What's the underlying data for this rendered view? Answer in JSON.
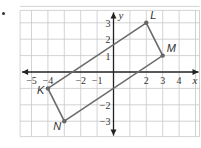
{
  "figure": {
    "problem_marker": ".",
    "axes": {
      "x_label": "x",
      "y_label": "y",
      "x_range": [
        -6,
        5
      ],
      "y_range": [
        -4,
        4
      ],
      "x_ticks": [
        {
          "value": -5,
          "label": "−5"
        },
        {
          "value": -4,
          "label": "−4"
        },
        {
          "value": -2,
          "label": "−2"
        },
        {
          "value": -1,
          "label": "−1"
        },
        {
          "value": 2,
          "label": "2"
        },
        {
          "value": 3,
          "label": "3"
        },
        {
          "value": 4,
          "label": "4"
        }
      ],
      "y_ticks": [
        {
          "value": 3,
          "label": "3"
        },
        {
          "value": 2,
          "label": "2"
        },
        {
          "value": 1,
          "label": "1"
        },
        {
          "value": -2,
          "label": "−2"
        },
        {
          "value": -3,
          "label": "−3"
        }
      ]
    },
    "quadrilateral": {
      "name": "KLMN",
      "vertices": [
        {
          "label": "K",
          "x": -4,
          "y": -1,
          "label_side": "left"
        },
        {
          "label": "L",
          "x": 2,
          "y": 3,
          "label_side": "upper-right"
        },
        {
          "label": "M",
          "x": 3,
          "y": 1,
          "label_side": "upper-right"
        },
        {
          "label": "N",
          "x": -3,
          "y": -3,
          "label_side": "lower-left"
        }
      ],
      "stroke_color": "#6b6b6b"
    }
  }
}
